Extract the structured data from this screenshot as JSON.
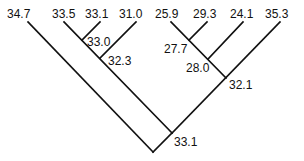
{
  "diagram": {
    "type": "tree",
    "leaves": [
      {
        "id": "L1",
        "label": "34.7",
        "x": 28,
        "y": 21
      },
      {
        "id": "L2",
        "label": "33.5",
        "x": 64,
        "y": 21
      },
      {
        "id": "L3",
        "label": "33.1",
        "x": 100,
        "y": 21
      },
      {
        "id": "L4",
        "label": "31.0",
        "x": 136,
        "y": 21
      },
      {
        "id": "L5",
        "label": "25.9",
        "x": 171,
        "y": 21
      },
      {
        "id": "L6",
        "label": "29.3",
        "x": 207,
        "y": 21
      },
      {
        "id": "L7",
        "label": "24.1",
        "x": 243,
        "y": 21
      },
      {
        "id": "L8",
        "label": "35.3",
        "x": 280,
        "y": 21
      }
    ],
    "internal_nodes": [
      {
        "id": "N1",
        "label": "33.0",
        "x": 82,
        "y": 39,
        "children": [
          "L2",
          "L3"
        ]
      },
      {
        "id": "N2",
        "label": "32.3",
        "x": 100,
        "y": 57,
        "children": [
          "N1",
          "L4"
        ]
      },
      {
        "id": "N3",
        "label": "27.7",
        "x": 189,
        "y": 39,
        "children": [
          "L5",
          "L6"
        ]
      },
      {
        "id": "N4",
        "label": "28.0",
        "x": 208,
        "y": 58,
        "children": [
          "N3",
          "L7"
        ]
      },
      {
        "id": "N5",
        "label": "32.1",
        "x": 226,
        "y": 77,
        "children": [
          "N4",
          "L8"
        ]
      },
      {
        "id": "N6",
        "label": "33.1",
        "x": 172,
        "y": 133,
        "children": [
          "N2",
          "N5"
        ]
      },
      {
        "id": "ROOT",
        "label": "",
        "x": 153,
        "y": 152,
        "children": [
          "L1",
          "N6"
        ]
      }
    ]
  }
}
